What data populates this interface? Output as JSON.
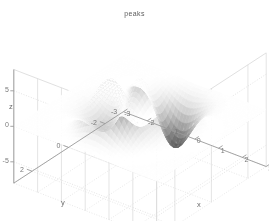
{
  "figure": {
    "width": 269,
    "height": 221,
    "background": "#ffffff"
  },
  "chart_data": {
    "type": "surface",
    "title": "peaks",
    "xlabel": "x",
    "ylabel": "y",
    "zlabel": "z",
    "xlim": [
      -3,
      3
    ],
    "ylim": [
      -3,
      3
    ],
    "zlim": [
      -8,
      8
    ],
    "xticks": [
      -3,
      -2,
      -1,
      0,
      1,
      2,
      3
    ],
    "xticklabels": [
      "-3",
      "-2",
      "-1",
      "0",
      "1",
      "2",
      "3"
    ],
    "yticks": [
      -2,
      0,
      2
    ],
    "yticklabels": [
      "-2",
      "0",
      "2"
    ],
    "zticks": [
      -5,
      0,
      5
    ],
    "zticklabels": [
      "-5",
      "0",
      "5"
    ],
    "grid": true,
    "colormap": "gray",
    "shading": "interp",
    "view_azimuth": -37.5,
    "view_elevation": 30,
    "function": "peaks",
    "formula": "z = 3*(1-x)^2*exp(-x^2-(y+1)^2) - 10*(x/5 - x^3 - y^5)*exp(-x^2-y^2) - 1/3*exp(-(x+1)^2 - y^2)",
    "grid_n": 49,
    "zmax": 8.1,
    "zmin": -6.5,
    "features": [
      {
        "name": "primary-peak",
        "x": -0.01,
        "y": 1.58,
        "z": 8.1
      },
      {
        "name": "secondary-peak",
        "x": 1.29,
        "y": -0.01,
        "z": 3.78
      },
      {
        "name": "primary-valley",
        "x": 0.23,
        "y": -1.63,
        "z": -6.55
      },
      {
        "name": "secondary-valley",
        "x": -1.35,
        "y": 0.21,
        "z": -3.05
      }
    ],
    "axis_color": "#9a9a9a",
    "grid_color": "#d8d8d8",
    "tick_text_color": "#7a7a7a",
    "title_color": "#5c5c5c"
  },
  "labels": {
    "title": "peaks",
    "x_axis_name": "x",
    "y_axis_name": "y",
    "z_axis_name": "z"
  }
}
